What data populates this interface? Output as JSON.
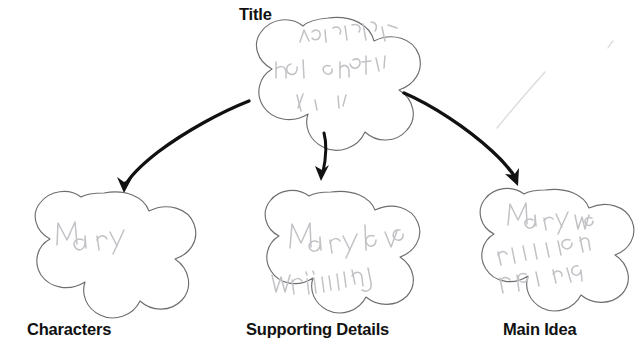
{
  "worksheet": {
    "type": "graphic-organizer",
    "background_color": "#ffffff",
    "outline_color": "#6e6e72",
    "arrow_color": "#111111",
    "pencil_color": "#c2c2c6",
    "label_color": "#111111"
  },
  "nodes": {
    "title": {
      "label": "Title",
      "handwriting": "the greatest who saw the world",
      "shape": "five-lobed-cloud"
    },
    "characters": {
      "label": "Characters",
      "handwriting": "Mary",
      "shape": "five-lobed-cloud"
    },
    "supporting_details": {
      "label": "Supporting Details",
      "handwriting": "Mary loved writing",
      "shape": "five-lobed-cloud"
    },
    "main_idea": {
      "label": "Main Idea",
      "handwriting": "Mary was a great writer",
      "shape": "five-lobed-cloud"
    }
  },
  "arrows": {
    "to_characters": "curved-arrow-down-left",
    "to_supporting_details": "short-arrow-down",
    "to_main_idea": "curved-arrow-down-right"
  }
}
